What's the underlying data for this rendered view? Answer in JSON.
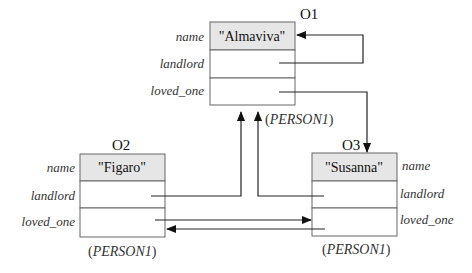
{
  "diagram": {
    "class_name": "PERSON1",
    "objects": [
      {
        "id": "O1",
        "fields": [
          {
            "name": "name",
            "value": "\"Almaviva\""
          },
          {
            "name": "landlord",
            "value": ""
          },
          {
            "name": "loved_one",
            "value": ""
          }
        ],
        "class_label_prefix": "(",
        "class_label_name": "PERSON1",
        "class_label_suffix": ")"
      },
      {
        "id": "O2",
        "fields": [
          {
            "name": "name",
            "value": "\"Figaro\""
          },
          {
            "name": "landlord",
            "value": ""
          },
          {
            "name": "loved_one",
            "value": ""
          }
        ],
        "class_label_prefix": "(",
        "class_label_name": "PERSON1",
        "class_label_suffix": ")"
      },
      {
        "id": "O3",
        "fields": [
          {
            "name": "name",
            "value": "\"Susanna\""
          },
          {
            "name": "landlord",
            "value": ""
          },
          {
            "name": "loved_one",
            "value": ""
          }
        ],
        "class_label_prefix": "(",
        "class_label_name": "PERSON1",
        "class_label_suffix": ")"
      }
    ],
    "references": [
      {
        "from": "O1.landlord",
        "to": "O1"
      },
      {
        "from": "O1.loved_one",
        "to": "O3"
      },
      {
        "from": "O2.landlord",
        "to": "O1"
      },
      {
        "from": "O2.loved_one",
        "to": "O3"
      },
      {
        "from": "O3.landlord",
        "to": "O1"
      },
      {
        "from": "O3.loved_one",
        "to": "O2"
      }
    ],
    "colors": {
      "box_border": "#666666",
      "name_cell_fill": "#e6e6e6",
      "arrow": "#222222"
    }
  }
}
